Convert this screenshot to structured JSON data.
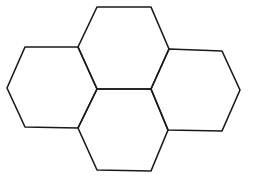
{
  "diagram": {
    "title": "",
    "stroke_color": "#1a1a1a",
    "background": "#ffffff",
    "hexagons": [
      {
        "name": "top",
        "points": "97,7 151,7 169,49 151,89 97,89 78,47"
      },
      {
        "name": "left",
        "points": "25,47 78,47 97,89 78,128 25,127 7,88"
      },
      {
        "name": "right",
        "points": "169,49 222,51 240,90 222,131 168,130 151,89"
      },
      {
        "name": "bottom",
        "points": "97,89 151,89 168,130 151,171 97,170 78,128"
      }
    ]
  }
}
